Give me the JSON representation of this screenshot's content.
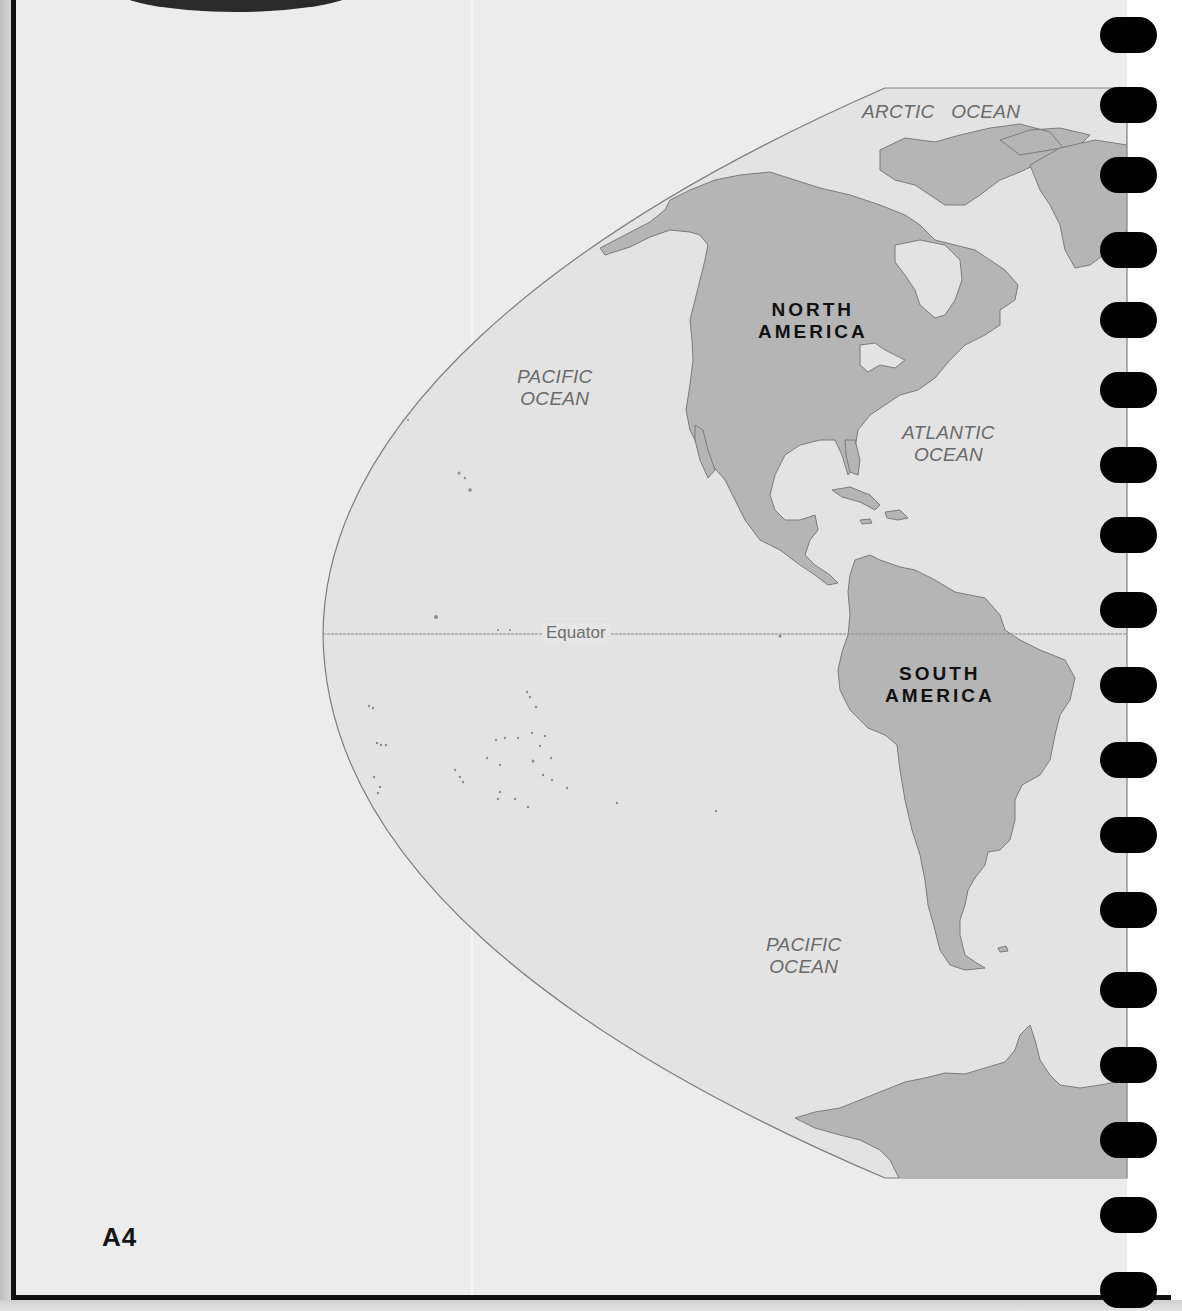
{
  "page": {
    "page_number": "A4",
    "colors": {
      "paper": "#ececec",
      "ocean": "#e3e3e3",
      "land": "#b5b5b5",
      "coastline": "#7a7a7a",
      "border": "#111111",
      "binding_holes": "#000000"
    }
  },
  "map": {
    "projection": "hemisphere-western",
    "labels": {
      "arctic_ocean": "ARCTIC   OCEAN",
      "pacific_ocean_north_line1": "PACIFIC",
      "pacific_ocean_north_line2": "OCEAN",
      "atlantic_ocean_line1": "ATLANTIC",
      "atlantic_ocean_line2": "OCEAN",
      "pacific_ocean_south_line1": "PACIFIC",
      "pacific_ocean_south_line2": "OCEAN",
      "north_america_line1": "NORTH",
      "north_america_line2": "AMERICA",
      "south_america_line1": "SOUTH",
      "south_america_line2": "AMERICA",
      "equator": "Equator"
    },
    "continents": [
      "North America",
      "South America",
      "Antarctica"
    ],
    "oceans": [
      "Arctic Ocean",
      "Pacific Ocean",
      "Atlantic Ocean"
    ]
  },
  "binding": {
    "hole_count": 18,
    "hole_centers_y": [
      35,
      105,
      175,
      250,
      320,
      390,
      465,
      535,
      610,
      685,
      760,
      835,
      910,
      990,
      1065,
      1140,
      1215,
      1290
    ]
  }
}
